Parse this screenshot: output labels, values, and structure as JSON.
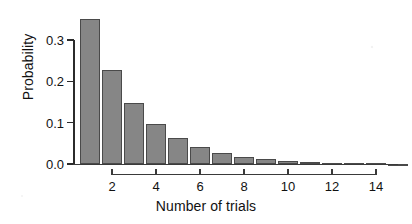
{
  "chart_data": {
    "type": "bar",
    "title": "",
    "xlabel": "Number of trials",
    "ylabel": "Probability",
    "categories": [
      1,
      2,
      3,
      4,
      5,
      6,
      7,
      8,
      9,
      10,
      11,
      12,
      13,
      14,
      15
    ],
    "values": [
      0.35,
      0.2275,
      0.1479,
      0.0961,
      0.0625,
      0.0406,
      0.0264,
      0.0172,
      0.0112,
      0.0073,
      0.0047,
      0.0031,
      0.002,
      0.0013,
      0.0008
    ],
    "xlim": [
      0.4,
      15.4
    ],
    "ylim": [
      0.0,
      0.35
    ],
    "grid": false,
    "legend": null,
    "bar_color": "#868686",
    "bar_edge_color": "#4a4a4a",
    "axis_color": "#2b2b2b",
    "y_ticks": [
      {
        "value": 0.0,
        "label": "0.0"
      },
      {
        "value": 0.1,
        "label": "0.1"
      },
      {
        "value": 0.2,
        "label": "0.2"
      },
      {
        "value": 0.3,
        "label": "0.3"
      }
    ],
    "x_ticks": [
      {
        "value": 2,
        "label": "2"
      },
      {
        "value": 4,
        "label": "4"
      },
      {
        "value": 6,
        "label": "6"
      },
      {
        "value": 8,
        "label": "8"
      },
      {
        "value": 10,
        "label": "10"
      },
      {
        "value": 12,
        "label": "12"
      },
      {
        "value": 14,
        "label": "14"
      }
    ]
  }
}
